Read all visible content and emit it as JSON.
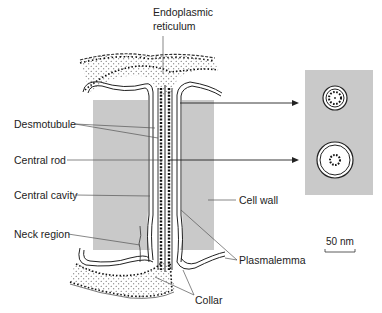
{
  "diagram": {
    "labels": {
      "er_line1": "Endoplasmic",
      "er_line2": "reticulum",
      "desmotubule": "Desmotubule",
      "central_rod": "Central rod",
      "central_cavity": "Central cavity",
      "neck_region": "Neck region",
      "cell_wall": "Cell wall",
      "plasmalemma": "Plasmalemma",
      "collar": "Collar",
      "scale_bar": "50 nm"
    },
    "colors": {
      "cell_wall_gray": "#c8c8c8",
      "line": "#2a2a2a",
      "dots": "#1a1a1a",
      "background": "#ffffff"
    },
    "cross_sections": [
      {
        "name": "upper cross-section",
        "type": "narrow"
      },
      {
        "name": "lower cross-section",
        "type": "wide"
      }
    ]
  }
}
